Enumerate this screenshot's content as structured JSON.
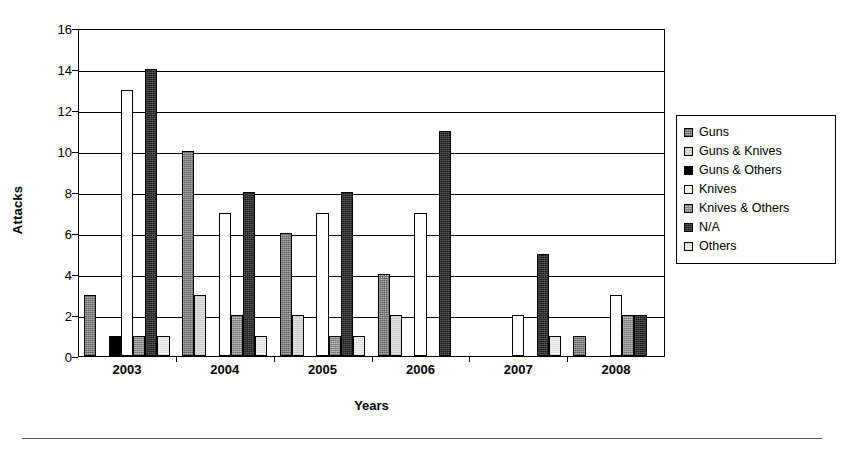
{
  "chart_data": {
    "type": "bar",
    "title": "",
    "xlabel": "Years",
    "ylabel": "Attacks",
    "categories": [
      "2003",
      "2004",
      "2005",
      "2006",
      "2007",
      "2008"
    ],
    "ylim": [
      0,
      16
    ],
    "ytick_values": [
      0,
      2,
      4,
      6,
      8,
      10,
      12,
      14,
      16
    ],
    "ytick_labels": [
      "0",
      "2",
      "4",
      "6",
      "8",
      "10",
      "12",
      "14",
      "16"
    ],
    "grid": true,
    "legend_position": "right",
    "series": [
      {
        "name": "Guns",
        "pattern": "dark-gray-hatch",
        "color": "#8e8e8e",
        "values": [
          3,
          10,
          6,
          4,
          0,
          1
        ]
      },
      {
        "name": "Guns & Knives",
        "pattern": "light-gray",
        "color": "#e2e2e2",
        "values": [
          0,
          3,
          2,
          2,
          0,
          0
        ]
      },
      {
        "name": "Guns & Others",
        "pattern": "solid-black",
        "color": "#000000",
        "values": [
          1,
          0,
          0,
          0,
          0,
          0
        ]
      },
      {
        "name": "Knives",
        "pattern": "white",
        "color": "#ffffff",
        "values": [
          13,
          7,
          7,
          7,
          2,
          3
        ]
      },
      {
        "name": "Knives & Others",
        "pattern": "medium-gray-hatch",
        "color": "#a6a6a6",
        "values": [
          1,
          2,
          1,
          0,
          0,
          2
        ]
      },
      {
        "name": "N/A",
        "pattern": "black-hatch",
        "color": "#1c1c1c",
        "values": [
          14,
          8,
          8,
          11,
          5,
          2
        ]
      },
      {
        "name": "Others",
        "pattern": "very-light-gray",
        "color": "#f0f0f0",
        "values": [
          1,
          1,
          1,
          0,
          1,
          0
        ]
      }
    ]
  },
  "legend": {
    "items": [
      {
        "label": "Guns"
      },
      {
        "label": "Guns & Knives"
      },
      {
        "label": "Guns & Others"
      },
      {
        "label": "Knives"
      },
      {
        "label": "Knives & Others"
      },
      {
        "label": "N/A"
      },
      {
        "label": "Others"
      }
    ]
  }
}
